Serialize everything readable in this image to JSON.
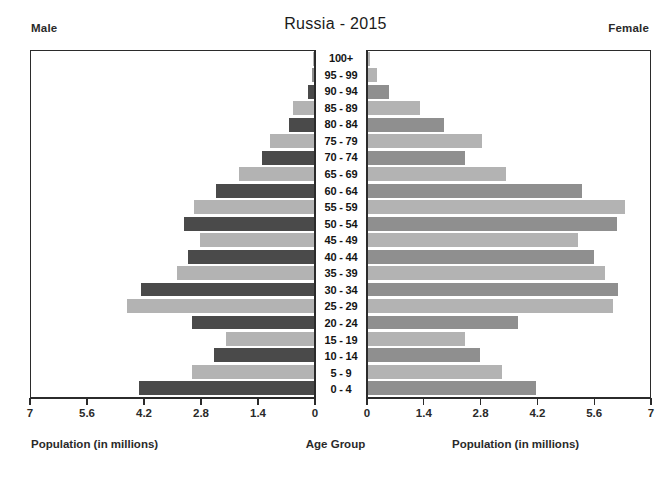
{
  "header": {
    "title": "Russia - 2015",
    "male_label": "Male",
    "female_label": "Female"
  },
  "captions": {
    "left_axis": "Population (in millions)",
    "center_axis": "Age Group",
    "right_axis": "Population (in millions)"
  },
  "colors": {
    "bar_dark": "#4a4a4a",
    "bar_light": "#b3b3b3",
    "bar_mid": "#8f8f8f",
    "frame": "#2b2b2b",
    "background": "#ffffff",
    "text": "#1b1b1b"
  },
  "chart_data": {
    "type": "bar",
    "title": "Russia - 2015",
    "subtitle": "",
    "chart_kind": "population-pyramid",
    "xlabel": "Population (in millions)",
    "ylabel": "Age Group",
    "xlim": [
      0,
      7
    ],
    "grid": false,
    "legend": [
      "Male",
      "Female"
    ],
    "legend_position": "top-outside",
    "left_ticks": [
      "7",
      "5.6",
      "4.2",
      "2.8",
      "1.4",
      "0"
    ],
    "right_ticks": [
      "0",
      "1.4",
      "2.8",
      "4.2",
      "5.6",
      "7"
    ],
    "tick_values": [
      0,
      1.4,
      2.8,
      4.2,
      5.6,
      7
    ],
    "categories": [
      "100+",
      "95 - 99",
      "90 - 94",
      "85 - 89",
      "80 - 84",
      "75 - 79",
      "70 - 74",
      "65 - 69",
      "60 - 64",
      "55 - 59",
      "50 - 54",
      "45 - 49",
      "40 - 44",
      "35 - 39",
      "30 - 34",
      "25 - 29",
      "20 - 24",
      "15 - 19",
      "10 - 14",
      "5 - 9",
      "0 - 4"
    ],
    "series": [
      {
        "name": "Male",
        "side": "left",
        "values": [
          0.02,
          0.06,
          0.16,
          0.52,
          0.62,
          1.08,
          1.28,
          1.86,
          2.42,
          2.96,
          3.22,
          2.82,
          3.12,
          3.38,
          4.28,
          4.62,
          3.02,
          2.18,
          2.48,
          3.02,
          4.32
        ]
      },
      {
        "name": "Female",
        "side": "right",
        "values": [
          0.04,
          0.22,
          0.52,
          1.3,
          1.88,
          2.82,
          2.4,
          3.42,
          5.32,
          6.38,
          6.18,
          5.22,
          5.62,
          5.88,
          6.2,
          6.08,
          3.72,
          2.42,
          2.78,
          3.32,
          4.18
        ]
      }
    ]
  }
}
